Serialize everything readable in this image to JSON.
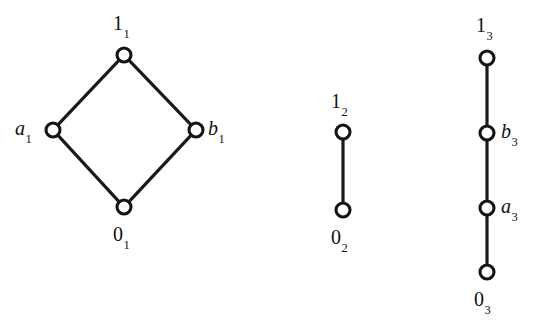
{
  "figure": {
    "kind": "hasse-diagram-figure",
    "background_color": "#ffffff",
    "stroke_color": "#141414",
    "node_fill_color": "#ffffff",
    "width": 545,
    "height": 331
  },
  "diagrams": [
    {
      "id": "lattice-1",
      "shape": "diamond",
      "nodes": [
        {
          "id": "top-1",
          "base": "1",
          "sub": "1",
          "italic": false,
          "cx": 124,
          "cy": 55,
          "r": 7,
          "label_x": 113,
          "label_y": 13,
          "label_align": "above"
        },
        {
          "id": "left-a1",
          "base": "a",
          "sub": "1",
          "italic": true,
          "cx": 53,
          "cy": 130,
          "r": 7,
          "label_x": 15,
          "label_y": 118,
          "label_align": "left"
        },
        {
          "id": "right-b1",
          "base": "b",
          "sub": "1",
          "italic": true,
          "cx": 196,
          "cy": 130,
          "r": 7,
          "label_x": 208,
          "label_y": 118,
          "label_align": "right"
        },
        {
          "id": "bottom-01",
          "base": "0",
          "sub": "1",
          "italic": false,
          "cx": 124,
          "cy": 207,
          "r": 7,
          "label_x": 113,
          "label_y": 224,
          "label_align": "below"
        }
      ],
      "edges": [
        {
          "from": "left-a1",
          "to": "top-1"
        },
        {
          "from": "right-b1",
          "to": "top-1"
        },
        {
          "from": "bottom-01",
          "to": "left-a1"
        },
        {
          "from": "bottom-01",
          "to": "right-b1"
        }
      ]
    },
    {
      "id": "lattice-2",
      "shape": "chain-2",
      "nodes": [
        {
          "base": "1",
          "sub": "2",
          "id": "top-12",
          "italic": false,
          "cx": 343,
          "cy": 132,
          "r": 7,
          "label_x": 331,
          "label_y": 91,
          "label_align": "above"
        },
        {
          "base": "0",
          "sub": "2",
          "id": "bottom-02",
          "italic": false,
          "cx": 343,
          "cy": 210,
          "r": 7,
          "label_x": 331,
          "label_y": 227,
          "label_align": "below"
        }
      ],
      "edges": [
        {
          "from": "bottom-02",
          "to": "top-12"
        }
      ]
    },
    {
      "id": "lattice-3",
      "shape": "chain-4",
      "nodes": [
        {
          "base": "1",
          "sub": "3",
          "id": "top-13",
          "italic": false,
          "cx": 487,
          "cy": 58,
          "r": 7,
          "label_x": 476,
          "label_y": 15,
          "label_align": "above"
        },
        {
          "base": "b",
          "sub": "3",
          "id": "node-b3",
          "italic": true,
          "cx": 487,
          "cy": 133,
          "r": 7,
          "label_x": 501,
          "label_y": 121,
          "label_align": "right"
        },
        {
          "base": "a",
          "sub": "3",
          "id": "node-a3",
          "italic": true,
          "cx": 487,
          "cy": 208,
          "r": 7,
          "label_x": 501,
          "label_y": 196,
          "label_align": "right"
        },
        {
          "base": "0",
          "sub": "3",
          "id": "bottom-03",
          "italic": false,
          "cx": 487,
          "cy": 272,
          "r": 7,
          "label_x": 474,
          "label_y": 289,
          "label_align": "below"
        }
      ],
      "edges": [
        {
          "from": "node-b3",
          "to": "top-13"
        },
        {
          "from": "node-a3",
          "to": "node-b3"
        },
        {
          "from": "bottom-03",
          "to": "node-a3"
        }
      ]
    }
  ]
}
